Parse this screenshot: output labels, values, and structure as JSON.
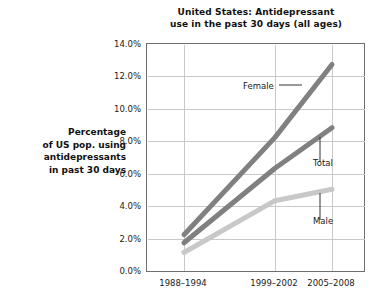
{
  "chart_data": {
    "type": "line",
    "title": "United States: Antidepressant use in the past 30 days (all ages)",
    "title_lines": [
      "United States: Antidepressant",
      "use in the past 30 days (all ages)"
    ],
    "xlabel": "",
    "ylabel": "Percentage of US pop. using antidepressants in past 30 days",
    "ylabel_lines": [
      "Percentage",
      "of US pop. using",
      "antidepressants",
      "in past 30 days"
    ],
    "categories": [
      "1988–1994",
      "1999–2002",
      "2005–2008"
    ],
    "ylim": [
      0,
      14
    ],
    "ytick_values": [
      0,
      2,
      4,
      6,
      8,
      10,
      12,
      14
    ],
    "ytick_labels": [
      "0.0%",
      "2.0%",
      "4.0%",
      "6.0%",
      "8.0%",
      "10.0%",
      "12.0%",
      "14.0%"
    ],
    "grid": true,
    "legend_position": "inline-annotations",
    "series": [
      {
        "name": "Female",
        "values": [
          2.3,
          8.3,
          12.8
        ],
        "color": "#808080",
        "label_text": "Female",
        "leader": "horizontal-right"
      },
      {
        "name": "Total",
        "values": [
          1.8,
          6.4,
          8.9
        ],
        "color": "#808080",
        "label_text": "Total",
        "leader": "vertical-up"
      },
      {
        "name": "Male",
        "values": [
          1.2,
          4.4,
          5.1
        ],
        "color": "#c8c8c8",
        "label_text": "Male",
        "leader": "vertical-up"
      }
    ],
    "colors": {
      "female_line": "#808080",
      "total_line": "#808080",
      "male_line": "#c8c8c8",
      "grid_line": "#c9c9c9",
      "axis_frame": "#6f6f6f",
      "text": "#1a1a1a",
      "background": "#ffffff"
    }
  }
}
